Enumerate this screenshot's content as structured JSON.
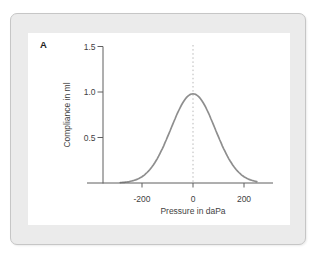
{
  "panel": {
    "label": "A"
  },
  "colors": {
    "panel_fill": "#ebebeb",
    "panel_border": "#c6c6c6",
    "plot_background": "#ffffff",
    "axis": "#5f5f5f",
    "curve": "#8e8e8e",
    "reference_line": "#b8b8b8",
    "text": "#3f3f3f"
  },
  "chart_data": {
    "type": "line",
    "title": "",
    "xlabel": "Pressure in daPa",
    "ylabel": "Compliance in ml",
    "xlim": [
      -415,
      315
    ],
    "ylim": [
      0,
      1.5
    ],
    "grid": false,
    "x_ticks": [
      -200,
      0,
      200
    ],
    "x_tick_labels": [
      "-200",
      "0",
      "200"
    ],
    "y_ticks": [
      0.5,
      1.0,
      1.5
    ],
    "y_tick_labels": [
      "0.5",
      "1.0",
      "1.5"
    ],
    "reference_line": {
      "pressure": 0,
      "style": "dotted",
      "extends_to_compliance": 1.51
    },
    "curve": {
      "shape": "gaussian",
      "peak_compliance": 0.98,
      "peak_pressure": 0,
      "sigma_daPa": 87,
      "pressure_range": [
        -285,
        250
      ],
      "points": [
        [
          -300,
          0.0
        ],
        [
          -250,
          0.01
        ],
        [
          -200,
          0.07
        ],
        [
          -150,
          0.22
        ],
        [
          -100,
          0.5
        ],
        [
          -50,
          0.83
        ],
        [
          0,
          0.98
        ],
        [
          50,
          0.83
        ],
        [
          100,
          0.5
        ],
        [
          150,
          0.22
        ],
        [
          200,
          0.07
        ],
        [
          250,
          0.01
        ],
        [
          300,
          0.0
        ]
      ]
    }
  }
}
